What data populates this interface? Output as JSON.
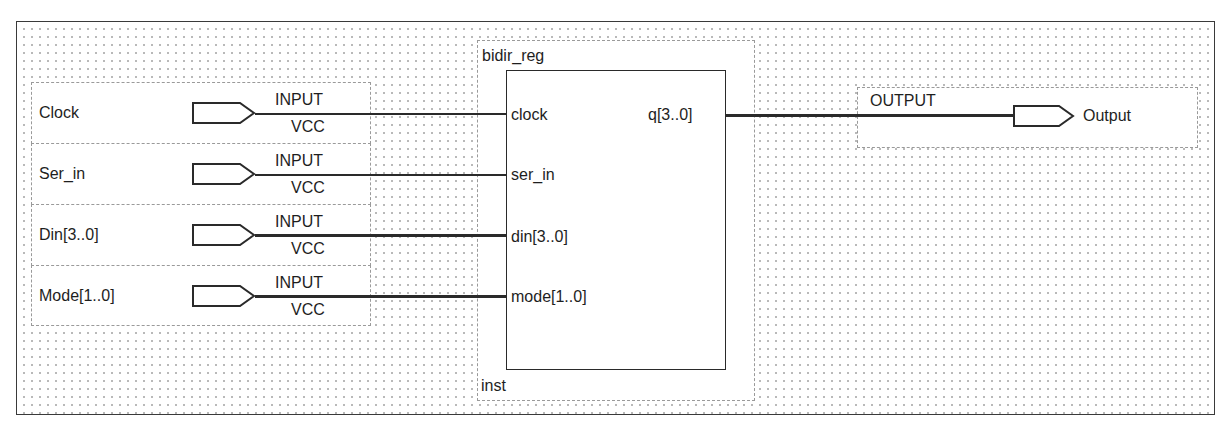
{
  "diagram": {
    "type": "schematic block diagram",
    "inputs": [
      {
        "name": "Clock",
        "pin_type": "INPUT",
        "default": "VCC",
        "connects_to": "clock",
        "bus": false
      },
      {
        "name": "Ser_in",
        "pin_type": "INPUT",
        "default": "VCC",
        "connects_to": "ser_in",
        "bus": false
      },
      {
        "name": "Din[3..0]",
        "pin_type": "INPUT",
        "default": "VCC",
        "connects_to": "din[3..0]",
        "bus": true
      },
      {
        "name": "Mode[1..0]",
        "pin_type": "INPUT",
        "default": "VCC",
        "connects_to": "mode[1..0]",
        "bus": true
      }
    ],
    "block": {
      "module": "bidir_reg",
      "instance": "inst",
      "ports_in": [
        "clock",
        "ser_in",
        "din[3..0]",
        "mode[1..0]"
      ],
      "ports_out": [
        "q[3..0]"
      ]
    },
    "output": {
      "pin_type": "OUTPUT",
      "name": "Output",
      "connects_from": "q[3..0]",
      "bus": true
    }
  },
  "colors": {
    "line": "#2a2a2a",
    "grid_dot": "#b9b9b9",
    "dashed_border": "#9a9a9a",
    "background": "#ffffff"
  }
}
